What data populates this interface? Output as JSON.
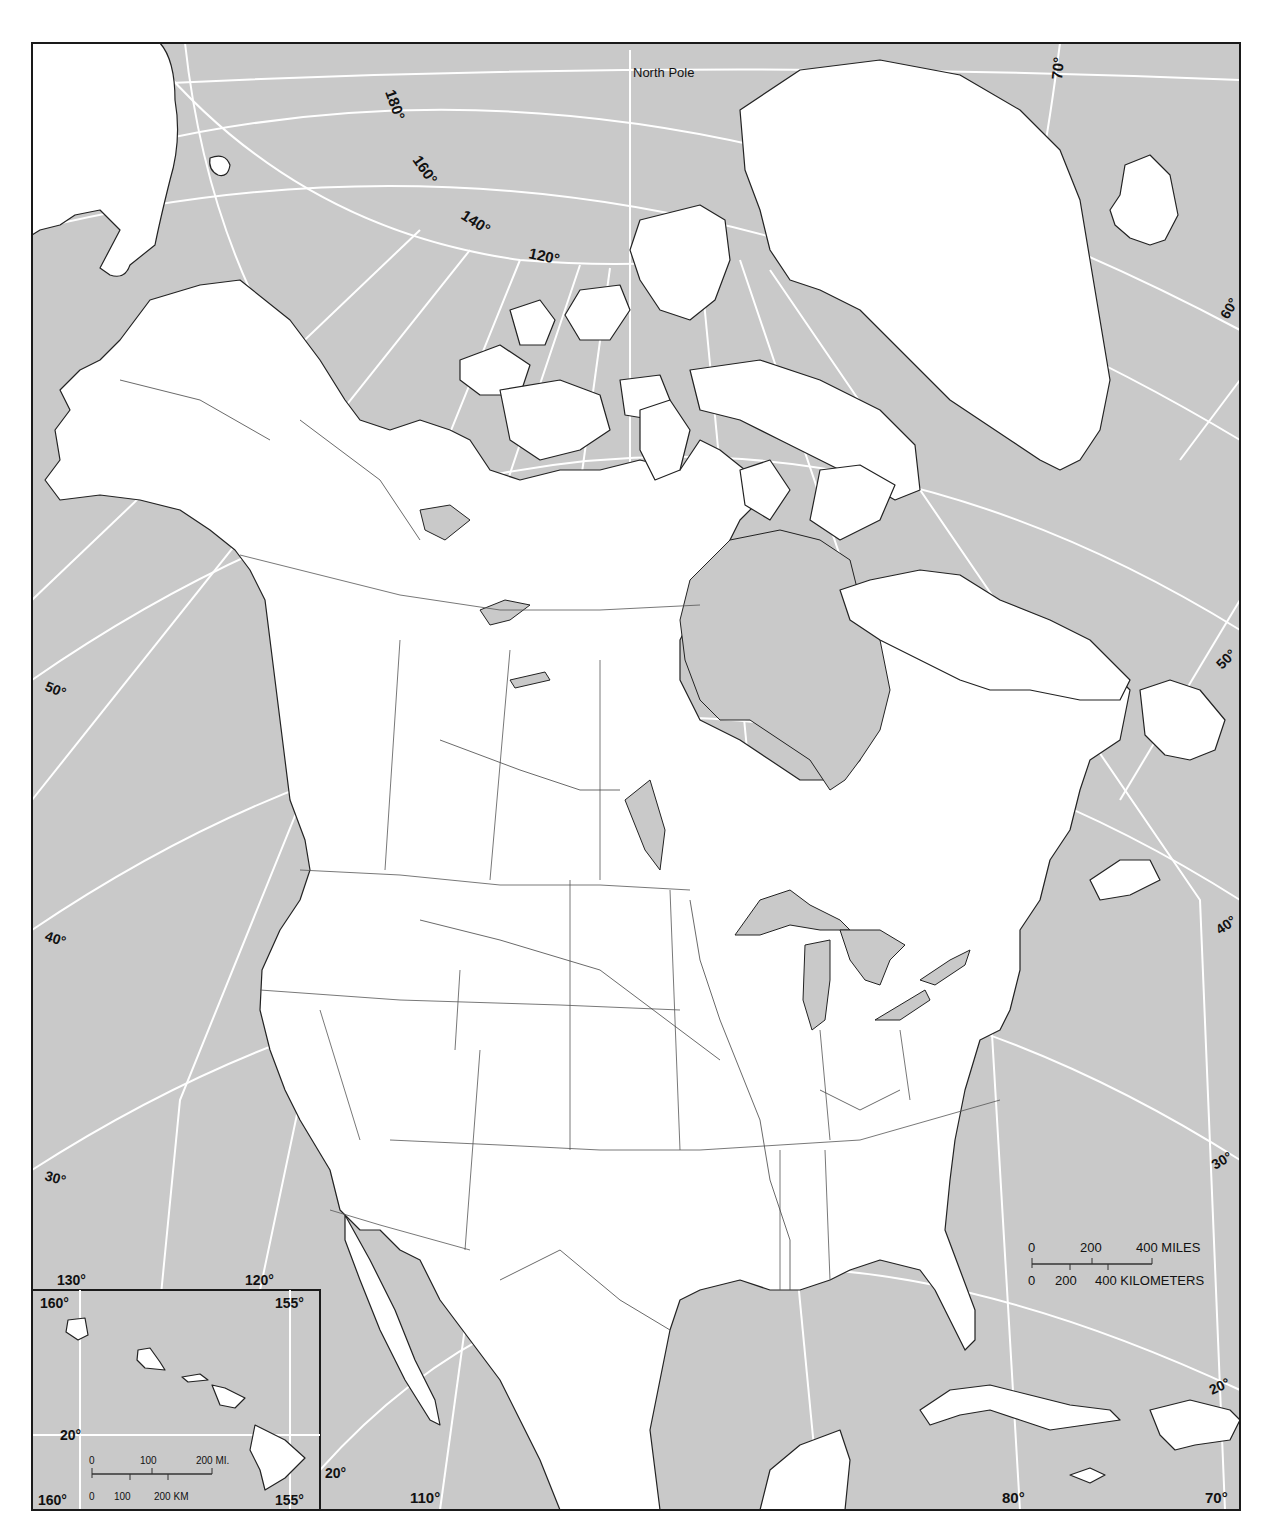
{
  "map": {
    "title_label": "North Pole",
    "colors": {
      "ocean": "#c9c9c9",
      "land": "#ffffff",
      "graticule": "#ffffff",
      "outline": "#222222",
      "frame": "#1a1a1a"
    },
    "longitude_labels_top": [
      "180°",
      "160°",
      "140°",
      "120°"
    ],
    "longitude_label_70_top": "70°",
    "latitude_labels_left": [
      "50°",
      "40°",
      "30°"
    ],
    "latitude_labels_right": [
      "60°",
      "50°",
      "40°",
      "30°",
      "20°"
    ],
    "longitude_labels_bottom": {
      "l130": "130°",
      "l120": "120°",
      "l110": "110°",
      "l80": "80°",
      "l70": "70°",
      "lat20": "20°"
    },
    "scale_bar": {
      "miles_0": "0",
      "miles_200": "200",
      "miles_400": "400 MILES",
      "km_0": "0",
      "km_200": "200",
      "km_400": "400 KILOMETERS"
    },
    "hawaii_inset": {
      "lon_160_top": "160°",
      "lon_155_top": "155°",
      "lon_160_bottom": "160°",
      "lon_155_bottom": "155°",
      "lat_20": "20°",
      "scale_mi_0": "0",
      "scale_mi_100": "100",
      "scale_mi_200": "200 MI.",
      "scale_km_0": "0",
      "scale_km_100": "100",
      "scale_km_200": "200 KM"
    }
  }
}
